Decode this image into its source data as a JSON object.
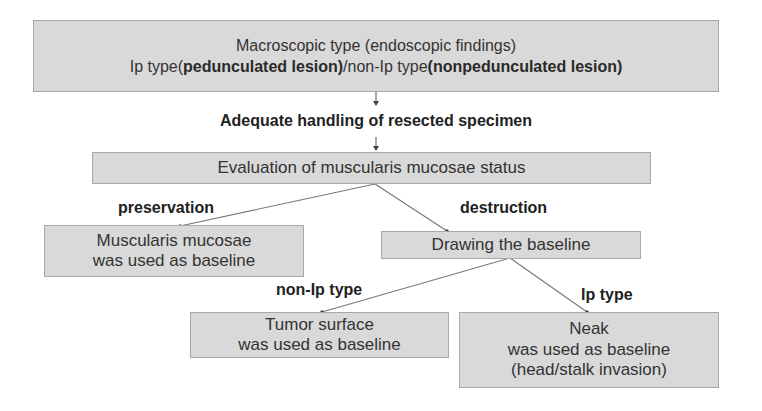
{
  "diagram": {
    "type": "flowchart",
    "colors": {
      "box_fill": "#d9d9d9",
      "box_border": "#a8a8a8",
      "connector": "#666666",
      "text": "#333333"
    },
    "nodes": {
      "macroscopic": {
        "line1": "Macroscopic type (endoscopic findings)",
        "line2_part1": "Ip type(",
        "line2_part2_bold": "pedunculated lesion)",
        "line2_part3": "/non-Ip type",
        "line2_part4_bold": "(nonpedunculated lesion)"
      },
      "handling": {
        "text": "Adequate handling of resected specimen"
      },
      "evaluation": {
        "text": "Evaluation of muscularis mucosae status"
      },
      "mm_baseline": {
        "line1": "Muscularis mucosae",
        "line2": "was used as baseline"
      },
      "drawing": {
        "text": "Drawing the baseline"
      },
      "tumor_surface": {
        "line1": "Tumor surface",
        "line2": "was used as baseline"
      },
      "neak": {
        "line1": "Neak",
        "line2": "was used as baseline",
        "line3": "(head/stalk invasion)"
      }
    },
    "edge_labels": {
      "preservation": "preservation",
      "destruction": "destruction",
      "non_ip_type": "non-Ip type",
      "ip_type": "Ip type"
    }
  }
}
